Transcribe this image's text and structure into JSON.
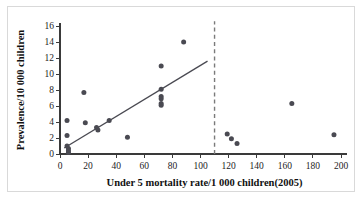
{
  "chart_data": {
    "type": "scatter",
    "title": "",
    "xlabel": "Under 5 mortality rate/1 000 children(2005)",
    "ylabel": "Prevalence/10 000 children",
    "xlim": [
      0,
      200
    ],
    "ylim": [
      0,
      16
    ],
    "xticks": [
      0,
      20,
      40,
      60,
      80,
      100,
      120,
      140,
      160,
      180,
      200
    ],
    "yticks": [
      0,
      2,
      4,
      6,
      8,
      10,
      12,
      14,
      16
    ],
    "grid": false,
    "legend": null,
    "series": [
      {
        "name": "countries",
        "marker": "filled-circle",
        "color": "#4a4a52",
        "points": [
          {
            "x": 5,
            "y": 4.2
          },
          {
            "x": 5,
            "y": 2.3
          },
          {
            "x": 5,
            "y": 1.0
          },
          {
            "x": 6,
            "y": 0.7
          },
          {
            "x": 6,
            "y": 0.4
          },
          {
            "x": 6,
            "y": 0.2
          },
          {
            "x": 17,
            "y": 7.7
          },
          {
            "x": 18,
            "y": 3.9
          },
          {
            "x": 26,
            "y": 3.3
          },
          {
            "x": 27,
            "y": 3.0
          },
          {
            "x": 35,
            "y": 4.2
          },
          {
            "x": 48,
            "y": 2.1
          },
          {
            "x": 72,
            "y": 11.0
          },
          {
            "x": 72,
            "y": 8.1
          },
          {
            "x": 72,
            "y": 7.2
          },
          {
            "x": 72,
            "y": 6.9
          },
          {
            "x": 72,
            "y": 6.3
          },
          {
            "x": 72,
            "y": 6.1
          },
          {
            "x": 88,
            "y": 14.0
          },
          {
            "x": 119,
            "y": 2.5
          },
          {
            "x": 122,
            "y": 1.9
          },
          {
            "x": 126,
            "y": 1.3
          },
          {
            "x": 165,
            "y": 6.3
          },
          {
            "x": 195,
            "y": 2.4
          }
        ]
      }
    ],
    "annotations": [
      {
        "type": "trend-line",
        "name": "regression-line",
        "x_start": 3,
        "y_start": 0.75,
        "x_end": 105,
        "y_end": 11.6,
        "color": "#4a4a52"
      },
      {
        "type": "vertical-dashed-line",
        "name": "threshold-line",
        "x": 110,
        "y_start": 0,
        "y_end": 16.6,
        "color": "#7a7a7a"
      }
    ]
  },
  "axes": {
    "y_label": "Prevalence/10 000 children",
    "x_label": "Under 5 mortality rate/1 000 children(2005)",
    "x_tick_labels": [
      "0",
      "20",
      "40",
      "60",
      "80",
      "100",
      "120",
      "140",
      "160",
      "180",
      "200"
    ],
    "y_tick_labels": [
      "0",
      "2",
      "4",
      "6",
      "8",
      "10",
      "12",
      "14",
      "16"
    ]
  },
  "colors": {
    "marker": "#4a4a52",
    "trend": "#4a4a52",
    "threshold": "#7a7a7a",
    "axis": "#3a3a3a",
    "frame": "#d9d9d9",
    "background": "#ffffff"
  }
}
